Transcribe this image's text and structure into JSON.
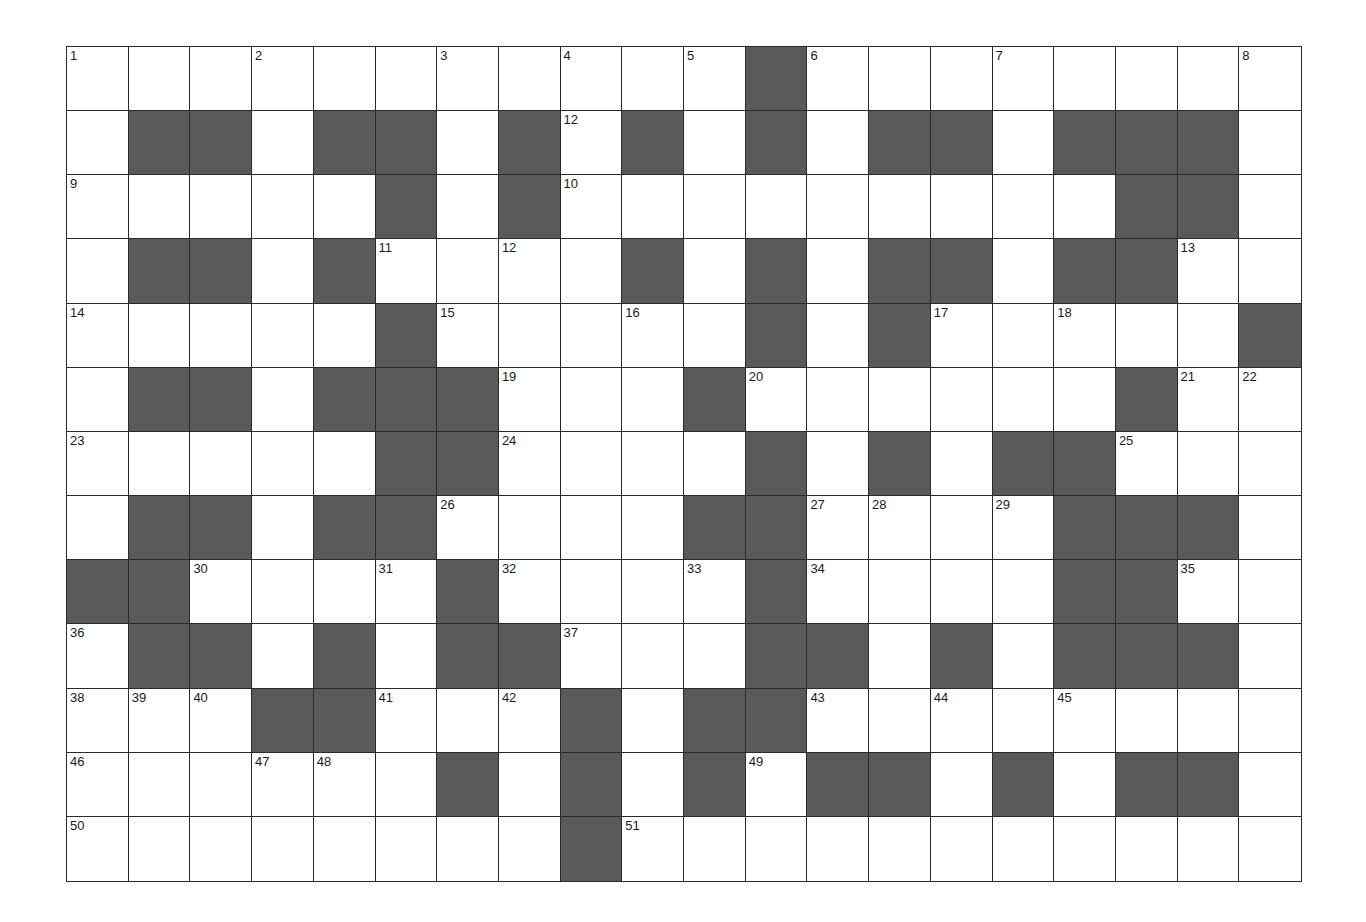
{
  "puzzle": {
    "rows": 13,
    "cols": 20,
    "colors": {
      "block": "#5a5a5a",
      "open": "#ffffff",
      "line": "#2a2a2a"
    },
    "dark_cells": [
      [
        11
      ],
      [
        1,
        2,
        4,
        5,
        7,
        9,
        11,
        13,
        14,
        16,
        17,
        18
      ],
      [
        5,
        7,
        17,
        18
      ],
      [
        1,
        2,
        4,
        9,
        11,
        13,
        14,
        16,
        17
      ],
      [
        5,
        11,
        13,
        19
      ],
      [
        1,
        2,
        4,
        5,
        6,
        10,
        17
      ],
      [
        5,
        6,
        11,
        13,
        15,
        16
      ],
      [
        1,
        2,
        4,
        5,
        10,
        11,
        16,
        17,
        18
      ],
      [
        0,
        1,
        6,
        11,
        16,
        17
      ],
      [
        1,
        2,
        4,
        6,
        7,
        11,
        12,
        14,
        16,
        17,
        18
      ],
      [
        3,
        4,
        8,
        10,
        11
      ],
      [
        6,
        8,
        10,
        12,
        13,
        15,
        17,
        18
      ],
      [
        8
      ]
    ],
    "numbers": [
      {
        "r": 0,
        "c": 0,
        "n": "1"
      },
      {
        "r": 0,
        "c": 3,
        "n": "2"
      },
      {
        "r": 0,
        "c": 6,
        "n": "3"
      },
      {
        "r": 0,
        "c": 8,
        "n": "4"
      },
      {
        "r": 0,
        "c": 10,
        "n": "5"
      },
      {
        "r": 0,
        "c": 12,
        "n": "6"
      },
      {
        "r": 0,
        "c": 15,
        "n": "7"
      },
      {
        "r": 0,
        "c": 19,
        "n": "8"
      },
      {
        "r": 1,
        "c": 8,
        "n": "12"
      },
      {
        "r": 2,
        "c": 0,
        "n": "9"
      },
      {
        "r": 2,
        "c": 8,
        "n": "10"
      },
      {
        "r": 3,
        "c": 5,
        "n": "11"
      },
      {
        "r": 3,
        "c": 7,
        "n": "12"
      },
      {
        "r": 3,
        "c": 18,
        "n": "13"
      },
      {
        "r": 4,
        "c": 0,
        "n": "14"
      },
      {
        "r": 4,
        "c": 6,
        "n": "15"
      },
      {
        "r": 4,
        "c": 9,
        "n": "16"
      },
      {
        "r": 4,
        "c": 14,
        "n": "17"
      },
      {
        "r": 4,
        "c": 16,
        "n": "18"
      },
      {
        "r": 5,
        "c": 7,
        "n": "19"
      },
      {
        "r": 5,
        "c": 11,
        "n": "20"
      },
      {
        "r": 5,
        "c": 18,
        "n": "21"
      },
      {
        "r": 5,
        "c": 19,
        "n": "22"
      },
      {
        "r": 6,
        "c": 0,
        "n": "23"
      },
      {
        "r": 6,
        "c": 7,
        "n": "24"
      },
      {
        "r": 6,
        "c": 17,
        "n": "25"
      },
      {
        "r": 7,
        "c": 6,
        "n": "26"
      },
      {
        "r": 7,
        "c": 12,
        "n": "27"
      },
      {
        "r": 7,
        "c": 13,
        "n": "28"
      },
      {
        "r": 7,
        "c": 15,
        "n": "29"
      },
      {
        "r": 8,
        "c": 2,
        "n": "30"
      },
      {
        "r": 8,
        "c": 5,
        "n": "31"
      },
      {
        "r": 8,
        "c": 7,
        "n": "32"
      },
      {
        "r": 8,
        "c": 10,
        "n": "33"
      },
      {
        "r": 8,
        "c": 12,
        "n": "34"
      },
      {
        "r": 8,
        "c": 18,
        "n": "35"
      },
      {
        "r": 9,
        "c": 0,
        "n": "36"
      },
      {
        "r": 9,
        "c": 8,
        "n": "37"
      },
      {
        "r": 10,
        "c": 0,
        "n": "38"
      },
      {
        "r": 10,
        "c": 1,
        "n": "39"
      },
      {
        "r": 10,
        "c": 2,
        "n": "40"
      },
      {
        "r": 10,
        "c": 5,
        "n": "41"
      },
      {
        "r": 10,
        "c": 7,
        "n": "42"
      },
      {
        "r": 10,
        "c": 12,
        "n": "43"
      },
      {
        "r": 10,
        "c": 14,
        "n": "44"
      },
      {
        "r": 10,
        "c": 16,
        "n": "45"
      },
      {
        "r": 11,
        "c": 0,
        "n": "46"
      },
      {
        "r": 11,
        "c": 3,
        "n": "47"
      },
      {
        "r": 11,
        "c": 4,
        "n": "48"
      },
      {
        "r": 11,
        "c": 11,
        "n": "49"
      },
      {
        "r": 12,
        "c": 0,
        "n": "50"
      },
      {
        "r": 12,
        "c": 9,
        "n": "51"
      }
    ]
  }
}
